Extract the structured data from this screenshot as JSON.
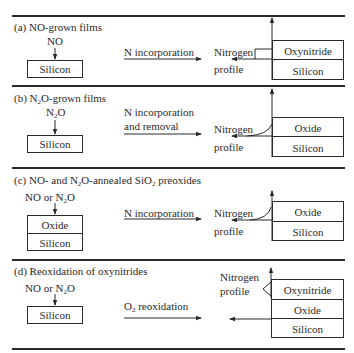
{
  "panels": [
    {
      "id": "a",
      "title": "(a) NO-grown films",
      "gas_label": "NO",
      "start_stack": [
        "Silicon"
      ],
      "process_label": [
        "N incorporation"
      ],
      "profile_label": [
        "Nitrogen",
        "profile"
      ],
      "end_stack": [
        "Oxynitride",
        "Silicon"
      ]
    },
    {
      "id": "b",
      "title_prefix": "(b) N",
      "title_sub": "2",
      "title_suffix": "O-grown films",
      "gas_prefix": "N",
      "gas_sub": "2",
      "gas_suffix": "O",
      "start_stack": [
        "Silicon"
      ],
      "process_label": [
        "N incorporation",
        "and removal"
      ],
      "profile_label": [
        "Nitrogen",
        "profile"
      ],
      "end_stack": [
        "Oxide",
        "Silicon"
      ]
    },
    {
      "id": "c",
      "title_prefix": "(c) NO- and N",
      "title_sub": "2",
      "title_mid": "O-annealed SiO",
      "title_sub2": "2",
      "title_suffix": " preoxides",
      "gas_prefix": "NO or N",
      "gas_sub": "2",
      "gas_suffix": "O",
      "start_stack": [
        "Oxide",
        "Silicon"
      ],
      "process_label": [
        "N incorporation"
      ],
      "profile_label": [
        "Nitrogen",
        "profile"
      ],
      "end_stack": [
        "Oxide",
        "Silicon"
      ]
    },
    {
      "id": "d",
      "title": "(d) Reoxidation of oxynitrides",
      "gas_prefix": "NO or N",
      "gas_sub": "2",
      "gas_suffix": "O",
      "start_stack": [
        "Silicon"
      ],
      "process_prefix": "O",
      "process_sub": "2",
      "process_suffix": " reoxidation",
      "profile_label": [
        "Nitrogen",
        "profile"
      ],
      "end_stack": [
        "Oxynitride",
        "Oxide",
        "Silicon"
      ]
    }
  ]
}
